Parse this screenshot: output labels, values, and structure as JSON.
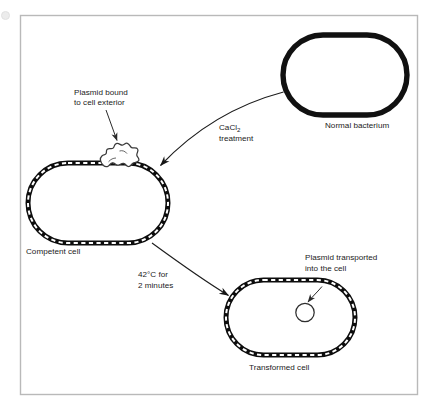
{
  "figure": {
    "type": "process-diagram",
    "frame": {
      "border_color": "#b4b4b4",
      "background": "#ffffff",
      "x": 20,
      "y": 15,
      "width": 398,
      "height": 380
    },
    "ink_color": "#111111",
    "text_color": "#1b1b1b"
  },
  "labels": {
    "plasmid_bound_line1": "Plasmid bound",
    "plasmid_bound_line2": "to cell exterior",
    "cacl2_line1_prefix": "CaCl",
    "cacl2_line1_subscript": "2",
    "cacl2_line2": "treatment",
    "normal_bacterium": "Normal bacterium",
    "competent_cell": "Competent cell",
    "heatshock_line1": "42°C for",
    "heatshock_line2": "2 minutes",
    "plasmid_transported_line1": "Plasmid transported",
    "plasmid_transported_line2": "into the cell",
    "transformed_cell": "Transformed cell"
  },
  "cells": [
    {
      "id": "normal-bacterium",
      "name": "Normal bacterium",
      "membrane_style": "solid-thick",
      "stroke_width": 5.2,
      "cx": 345,
      "cy": 75,
      "rx": 62,
      "ry": 40,
      "contents": []
    },
    {
      "id": "competent-cell",
      "name": "Competent cell",
      "membrane_style": "dashed-band",
      "stroke_width": 4.6,
      "cx": 98,
      "cy": 203,
      "rx": 70,
      "ry": 40,
      "contents": [
        "plasmid-exterior-squiggle"
      ]
    },
    {
      "id": "transformed-cell",
      "name": "Transformed cell",
      "membrane_style": "dashed-band",
      "stroke_width": 4.6,
      "cx": 290,
      "cy": 317,
      "rx": 65,
      "ry": 39,
      "contents": [
        "plasmid-interior-circle"
      ]
    }
  ],
  "arrows": [
    {
      "id": "cacl2-arrow",
      "name": "CaCl2 treatment arrow",
      "from": "normal-bacterium",
      "to": "competent-cell",
      "label": "CaCl2 treatment"
    },
    {
      "id": "heatshock-arrow",
      "name": "42C heat shock arrow",
      "from": "competent-cell",
      "to": "transformed-cell",
      "label": "42°C for 2 minutes"
    },
    {
      "id": "plasmid-bound-pointer",
      "name": "Pointer to exterior plasmid",
      "from": "plasmid bound label",
      "to": "plasmid-exterior-squiggle"
    },
    {
      "id": "plasmid-transported-pointer",
      "name": "Pointer to interior plasmid",
      "from": "plasmid transported label",
      "to": "plasmid-interior-circle"
    }
  ]
}
